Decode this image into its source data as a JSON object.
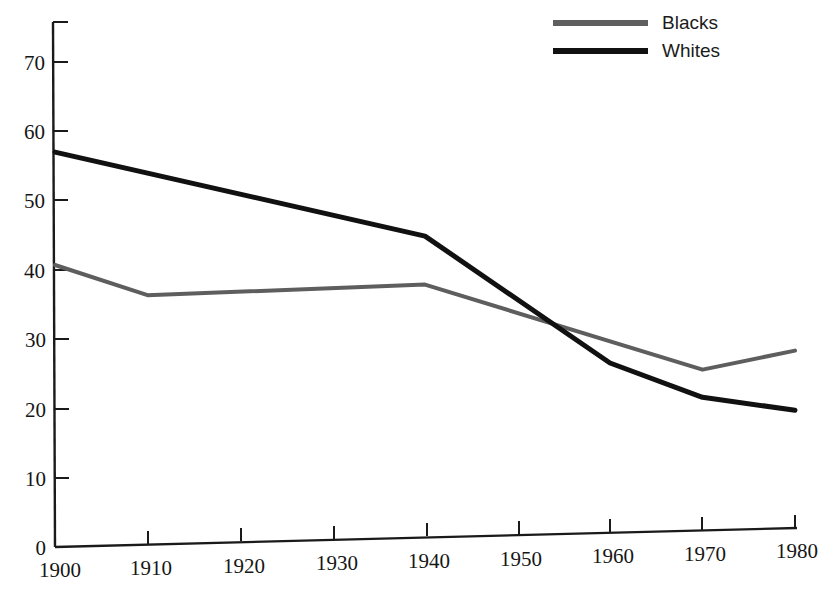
{
  "chart_data": {
    "type": "line",
    "title": "",
    "subtitle": "",
    "xlabel": "",
    "ylabel": "",
    "x": [
      1900,
      1910,
      1920,
      1930,
      1940,
      1950,
      1960,
      1970,
      1980
    ],
    "xlim": [
      1900,
      1980
    ],
    "ylim": [
      0,
      75
    ],
    "grid": false,
    "legend_position": "top-right",
    "x_tick_labels": [
      "1900",
      "1910",
      "1920",
      "1930",
      "1940",
      "1950",
      "1960",
      "1970",
      "1980"
    ],
    "y_tick_labels": [
      "0",
      "10",
      "20",
      "30",
      "40",
      "50",
      "60",
      "70"
    ],
    "y_ticks": [
      0,
      10,
      20,
      30,
      40,
      50,
      60,
      70
    ],
    "series": [
      {
        "name": "Blacks",
        "color": "#5e5e5e",
        "style": "solid-gray",
        "x": [
          1900,
          1910,
          1940,
          1970,
          1980
        ],
        "values": [
          40.7,
          36.0,
          36.5,
          23.2,
          25.6
        ]
      },
      {
        "name": "Whites",
        "color": "#111111",
        "style": "solid-black",
        "x": [
          1900,
          1940,
          1960,
          1970,
          1980
        ],
        "values": [
          57.0,
          43.5,
          24.5,
          19.2,
          17.0
        ]
      }
    ],
    "annotations": []
  },
  "legend": {
    "items": [
      {
        "label": "Blacks",
        "color": "#5e5e5e"
      },
      {
        "label": "Whites",
        "color": "#111111"
      }
    ]
  },
  "axes": {
    "y_axis_name": "value-axis",
    "x_axis_name": "year-axis"
  }
}
